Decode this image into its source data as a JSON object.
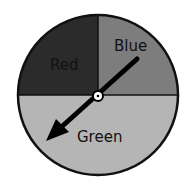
{
  "spinner": {
    "title": "Spinner",
    "sections": [
      {
        "label": "Red",
        "color": "#2b2b2b",
        "text_color": "#111111",
        "fraction": 0.25
      },
      {
        "label": "Blue",
        "color": "#7d7d7d",
        "text_color": "#111111",
        "fraction": 0.25
      },
      {
        "label": "Green",
        "color": "#b5b5b5",
        "text_color": "#111111",
        "fraction": 0.5
      }
    ],
    "arrow": {
      "points_to": "Green"
    }
  }
}
